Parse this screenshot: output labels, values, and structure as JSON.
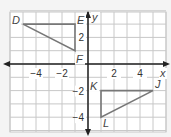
{
  "graph": {
    "x_range": [
      -6,
      6
    ],
    "y_range": [
      -5,
      4
    ],
    "axis_labels": {
      "x": "x",
      "y": "y"
    },
    "x_ticks": [
      {
        "value": -4,
        "label": "−4"
      },
      {
        "value": -2,
        "label": "−2"
      },
      {
        "value": 2,
        "label": "2"
      },
      {
        "value": 4,
        "label": "4"
      }
    ],
    "y_ticks": [
      {
        "value": 2,
        "label": "2"
      },
      {
        "value": -2,
        "label": "−2"
      },
      {
        "value": -4,
        "label": "−4"
      }
    ],
    "colors": {
      "background": "#f4f4f4",
      "grid": "#c8c8c8",
      "axis": "#222222",
      "triangle": "#777777"
    }
  },
  "triangles": [
    {
      "name": "DEF",
      "vertices": [
        {
          "label": "D",
          "x": -5,
          "y": 3
        },
        {
          "label": "E",
          "x": -1,
          "y": 3
        },
        {
          "label": "F",
          "x": -1,
          "y": 1
        }
      ]
    },
    {
      "name": "JKL",
      "vertices": [
        {
          "label": "K",
          "x": 1,
          "y": -2
        },
        {
          "label": "J",
          "x": 5,
          "y": -2
        },
        {
          "label": "L",
          "x": 1,
          "y": -4
        }
      ]
    }
  ]
}
